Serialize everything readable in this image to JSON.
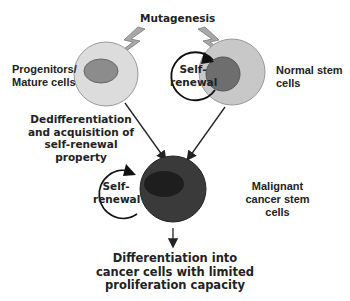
{
  "diagram": {
    "mutagenesis_label": "Mutagenesis",
    "progenitor_label_line1": "Progenitors/",
    "progenitor_label_line2": "Mature cells",
    "normal_stem_label_line1": "Normal stem",
    "normal_stem_label_line2": "cells",
    "dediff_line1": "Dedifferentiation",
    "dediff_line2": "and acquisition of",
    "dediff_line3": "self-renewal",
    "dediff_line4": "property",
    "self_renewal_top_line1": "Self-",
    "self_renewal_top_line2": "renewal",
    "self_renewal_bottom_line1": "Self-",
    "self_renewal_bottom_line2": "renewal",
    "malignant_line1": "Malignant",
    "malignant_line2": "cancer stem",
    "malignant_line3": "cells",
    "outcome_line1": "Differentiation into",
    "outcome_line2": "cancer cells with limited",
    "outcome_line3": "proliferation capacity"
  },
  "colors": {
    "progenitor_cell": "#dcdcdc",
    "progenitor_nucleus": "#8c8c8c",
    "normal_cell": "#c8c8c8",
    "normal_nucleus": "#6e6e6e",
    "malignant_cell": "#3a3a3a",
    "malignant_nucleus": "#222222",
    "bolt": "#9a9a9a",
    "line": "#222222"
  }
}
